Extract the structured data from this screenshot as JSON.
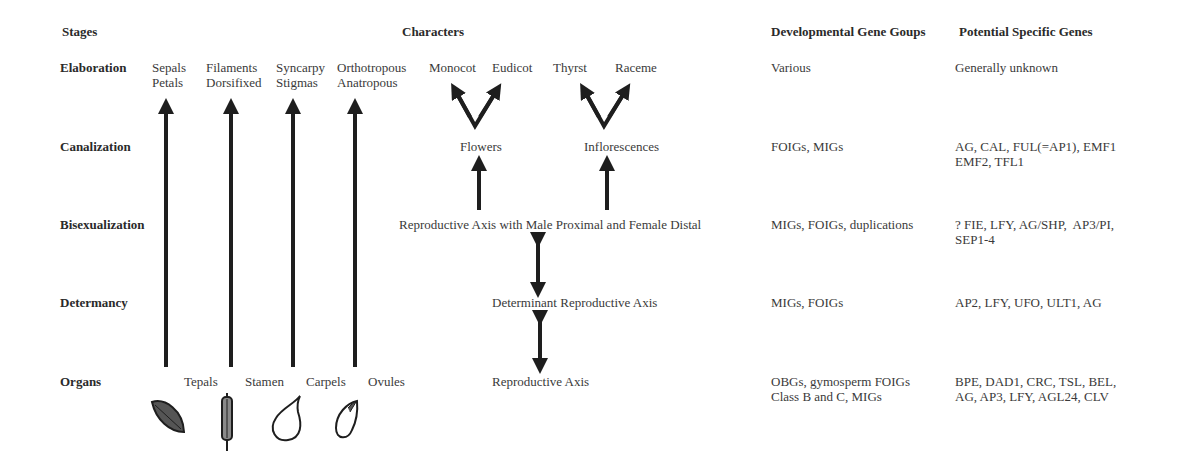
{
  "headers": {
    "stages": "Stages",
    "characters": "Characters",
    "gene_groups": "Developmental Gene Goups",
    "specific_genes": "Potential Specific Genes"
  },
  "stages": [
    {
      "name": "Elaboration",
      "gene_groups": "Various",
      "specific_genes": "Generally unknown"
    },
    {
      "name": "Canalization",
      "gene_groups": "FOIGs, MIGs",
      "specific_genes": "AG, CAL, FUL(=AP1), EMF1\nEMF2, TFL1"
    },
    {
      "name": "Bisexualization",
      "gene_groups": "MIGs, FOIGs, duplications",
      "specific_genes": "? FIE, LFY, AG/SHP,  AP3/PI,\nSEP1-4"
    },
    {
      "name": "Determancy",
      "gene_groups": "MIGs, FOIGs",
      "specific_genes": "AP2, LFY, UFO, ULT1, AG"
    },
    {
      "name": "Organs",
      "gene_groups": "OBGs, gymosperm FOIGs\nClass B and C, MIGs",
      "specific_genes": "BPE, DAD1, CRC, TSL, BEL,\nAG, AP3, LFY, AGL24, CLV"
    }
  ],
  "organ_characters": [
    {
      "organ": "Tepals",
      "elaboration": "Sepals\nPetals",
      "icon": "tepal-leaf-icon"
    },
    {
      "organ": "Stamen",
      "elaboration": "Filaments\nDorsifixed",
      "icon": "stamen-icon"
    },
    {
      "organ": "Carpels",
      "elaboration": "Syncarpy\nStigmas",
      "icon": "carpel-icon"
    },
    {
      "organ": "Ovules",
      "elaboration": "Orthotropous\nAnatropous",
      "icon": "ovule-icon"
    }
  ],
  "axis_characters": {
    "flowers": "Flowers",
    "flower_types": [
      "Monocot",
      "Eudicot"
    ],
    "inflorescences": "Inflorescences",
    "inflorescence_types": [
      "Thyrst",
      "Raceme"
    ],
    "bisexual_axis": "Reproductive Axis with Male Proximal and Female Distal",
    "determinant_axis": "Determinant Reproductive Axis",
    "reproductive_axis": "Reproductive Axis"
  },
  "colors": {
    "arrow": "#1e1e1e",
    "text": "#3a3a3a",
    "tepal_fill": "#555555",
    "stamen_fill": "#8a8a8a"
  }
}
